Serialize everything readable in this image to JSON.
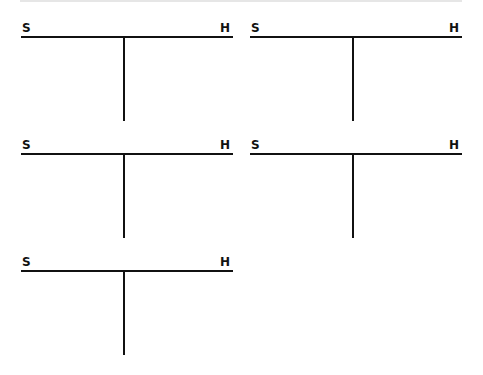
{
  "tcharts": [
    {
      "left_label": "S",
      "right_label": "H"
    },
    {
      "left_label": "S",
      "right_label": "H"
    },
    {
      "left_label": "S",
      "right_label": "H"
    },
    {
      "left_label": "S",
      "right_label": "H"
    },
    {
      "left_label": "S",
      "right_label": "H"
    }
  ]
}
